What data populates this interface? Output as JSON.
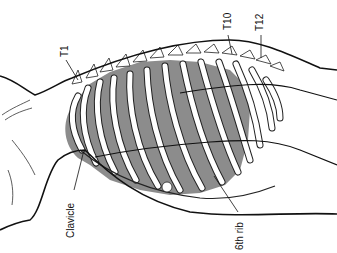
{
  "figure": {
    "colors": {
      "line": "#111111",
      "lung_shading": "#8c8c8c",
      "bone_fill": "#ffffff",
      "background": "#ffffff"
    },
    "labels": {
      "t1": "T1",
      "t10": "T10",
      "t12": "T12",
      "clavicle": "Clavicle",
      "sixth_rib": "6th rib"
    }
  }
}
